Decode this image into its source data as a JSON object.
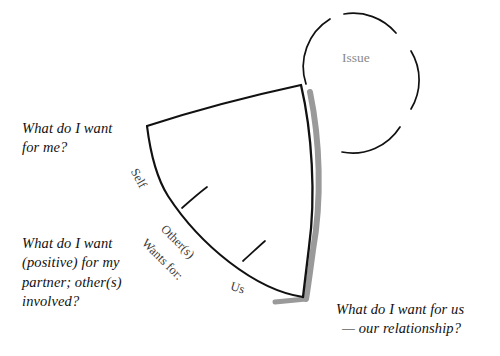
{
  "diagram": {
    "background": "#ffffff",
    "stroke_color": "#111111",
    "shadow_color": "#999999",
    "issue_text_color": "#8a8a8a",
    "arc_label_color": "#3a3a3a",
    "caption_color": "#111111"
  },
  "issue": {
    "label": "Issue"
  },
  "arc_labels": {
    "self": "Self",
    "others": "Other(s)",
    "wants_for": "Wants for:",
    "us": "Us"
  },
  "captions": {
    "self": "What do I want\nfor me?",
    "others": "What do I want\n(positive) for my\npartner; other(s)\ninvolved?",
    "us_line1": "What do I want for us",
    "us_line2": "— our relationship?"
  }
}
